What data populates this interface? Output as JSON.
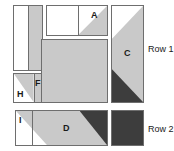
{
  "diagram": {
    "colors": {
      "light_fabric": "#c9c9c9",
      "dark_fabric": "#3d3d3d",
      "background_fabric": "#ffffff",
      "seam_line": "#6e6e6e",
      "text": "#1a1a1a"
    },
    "row_labels": [
      {
        "id": "row-1",
        "text": "Row 1"
      },
      {
        "id": "row-2",
        "text": "Row 2"
      }
    ],
    "pieces": [
      {
        "id": "piece-left-bar",
        "label": "",
        "description": "tall rectangle, white left half, light gray right half"
      },
      {
        "id": "piece-a",
        "label": "A",
        "description": "horizontal rectangle, white left, half-square triangle light gray at right"
      },
      {
        "id": "piece-c",
        "label": "C",
        "description": "tall rectangle, white triangle top-left, light gray body, dark gray triangle bottom-left"
      },
      {
        "id": "piece-center",
        "label": "",
        "description": "large light gray square"
      },
      {
        "id": "piece-h",
        "label": "H",
        "description": "square, white bottom-left triangle, light gray top-right triangle"
      },
      {
        "id": "piece-f",
        "label": "F",
        "description": "narrow light gray rectangle right of H"
      },
      {
        "id": "piece-i",
        "label": "I",
        "description": "white triangle at left end of the D strip"
      },
      {
        "id": "piece-d",
        "label": "D",
        "description": "wide strip, white triangle left, light gray trapezoid, dark gray triangle right"
      },
      {
        "id": "piece-dark-square",
        "label": "",
        "description": "solid dark gray square for row 2"
      }
    ]
  }
}
